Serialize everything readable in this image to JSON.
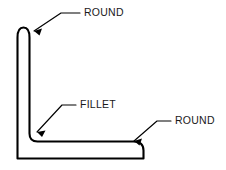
{
  "figure": {
    "type": "engineering-drawing",
    "background_color": "#ffffff",
    "line_color": "#000000",
    "text_color": "#1a1a1a"
  },
  "callouts": [
    {
      "id": "round-top",
      "label": "ROUND",
      "text_x": 84,
      "text_y": 13,
      "leader": "M 80 13 L 61 13 L 34 31",
      "arrow_points": "34,31 42,28.5 39.5,35.5",
      "target": "top-end-round"
    },
    {
      "id": "fillet-inner",
      "label": "FILLET",
      "text_x": 80,
      "text_y": 105,
      "leader": "M 76 105 L 62 105 L 37 132",
      "arrow_points": "37,132 45.5,130.5 42,137",
      "target": "inside-corner-fillet"
    },
    {
      "id": "round-right",
      "label": "ROUND",
      "text_x": 175,
      "text_y": 121,
      "leader": "M 171 121 L 157 121 L 134 141",
      "arrow_points": "134,141 142,138.5 139.5,145.5",
      "target": "right-end-round"
    }
  ],
  "geometry": {
    "outline_path": "M 17.5 158.5 L 17.5 37.5 Q 17.5 27.5 23.5 27.5 Q 29.5 27.5 29.5 37.5 L 29.5 133.5 Q 29.5 141.5 37.5 141.5 L 133.5 141.5 Q 143.5 141.5 143.5 150.5 L 143.5 158.5 Z",
    "vertical_leg": {
      "outer_x": 17.5,
      "inner_x": 29.5,
      "top_y": 27.5,
      "bottom_y": 158.5
    },
    "horizontal_leg": {
      "top_y": 141.5,
      "bottom_y": 158.5,
      "left_x": 17.5,
      "right_x": 143.5
    },
    "features": [
      {
        "name": "top-end-round",
        "kind": "round",
        "cx": 23.5,
        "cy": 37.5,
        "r": 6
      },
      {
        "name": "inside-corner-fillet",
        "kind": "fillet",
        "cx": 37.5,
        "cy": 133.5,
        "r": 8
      },
      {
        "name": "right-end-round",
        "kind": "round",
        "cx": 133.5,
        "cy": 150.5,
        "r": 10
      }
    ]
  }
}
